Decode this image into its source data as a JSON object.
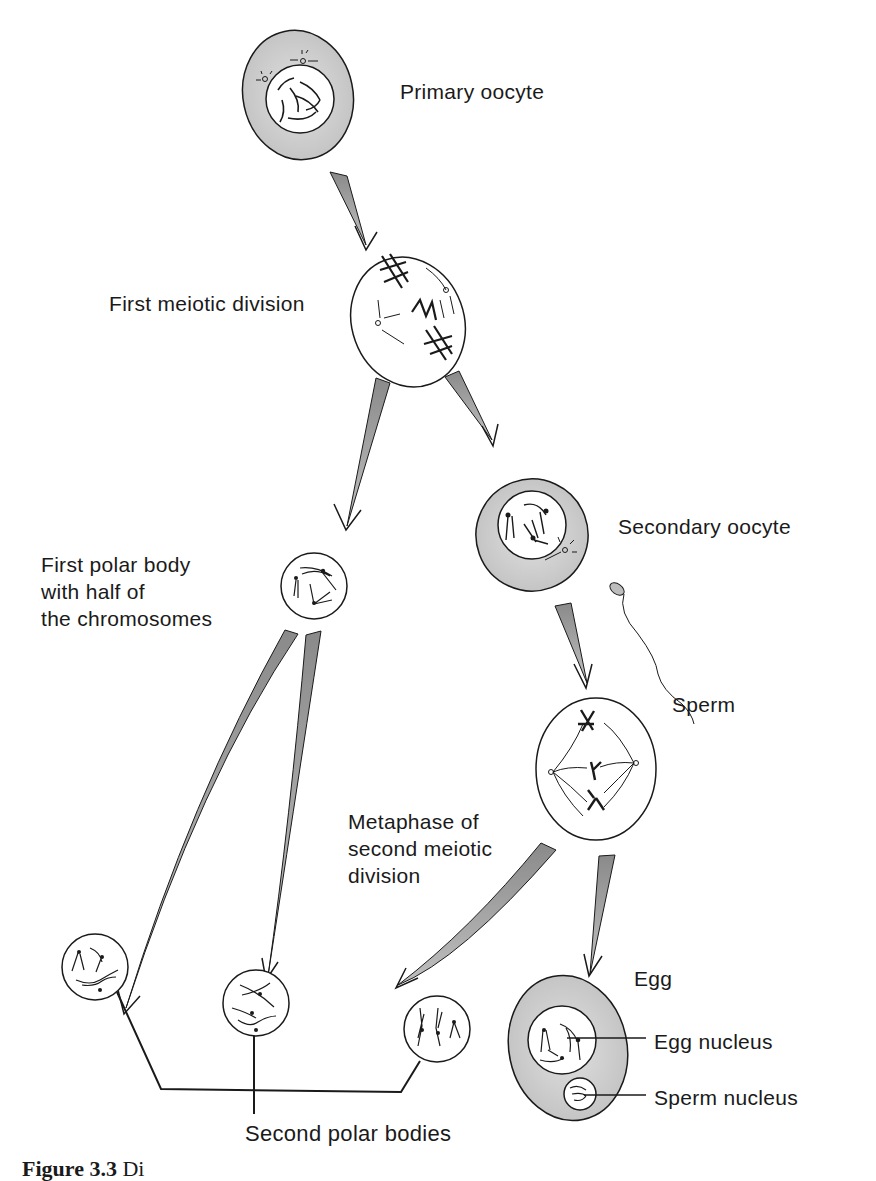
{
  "figure": {
    "caption_label": "Figure 3.3",
    "caption_rest": "  Di"
  },
  "stages": {
    "primary_oocyte": "Primary oocyte",
    "first_meiotic_division": "First meiotic division",
    "secondary_oocyte": "Secondary oocyte",
    "first_polar_body": "First polar body\nwith half of\nthe chromosomes",
    "sperm": "Sperm",
    "metaphase_second": "Metaphase of\nsecond meiotic\ndivision",
    "egg": "Egg",
    "egg_nucleus": "Egg nucleus",
    "sperm_nucleus": "Sperm nucleus",
    "second_polar_bodies": "Second polar bodies"
  },
  "colors": {
    "cytoplasm_fill": "#c9c9c9",
    "arrow_fill": "#9a9a9a",
    "line": "#1a1a1a"
  }
}
